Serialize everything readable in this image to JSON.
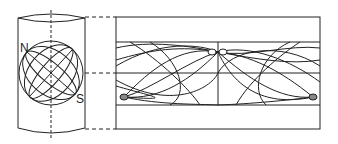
{
  "diagram": {
    "labels": {
      "north": "N",
      "south": "S"
    },
    "colors": {
      "stroke": "#222222",
      "background": "#ffffff"
    }
  }
}
